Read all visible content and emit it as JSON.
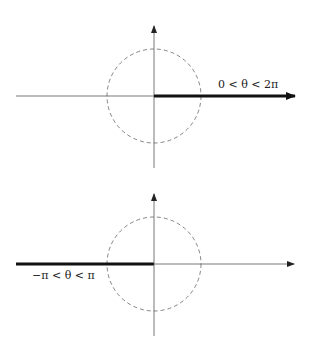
{
  "diagrams": [
    {
      "id": "top",
      "label": "0 < θ < 2π",
      "branch_cut": "positive real axis",
      "origin": [
        154,
        96
      ],
      "circle_radius": 47
    },
    {
      "id": "bottom",
      "label": "−π < θ < π",
      "branch_cut": "negative real axis",
      "origin": [
        154,
        264
      ],
      "circle_radius": 47
    }
  ],
  "colors": {
    "axis": "#555555",
    "cut": "#111111",
    "circle": "#666666"
  }
}
